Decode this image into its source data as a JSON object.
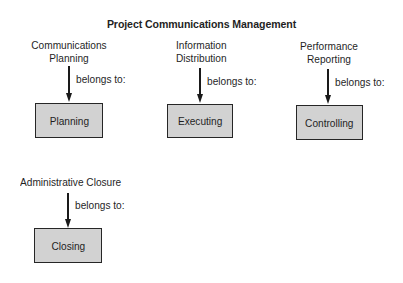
{
  "title": "Project Communications Management",
  "processes": [
    {
      "name_lines": [
        "Communications",
        "Planning"
      ],
      "relation": "belongs to:",
      "phase": "Planning"
    },
    {
      "name_lines": [
        "Information",
        "Distribution"
      ],
      "relation": "belongs to:",
      "phase": "Executing"
    },
    {
      "name_lines": [
        "Performance",
        "Reporting"
      ],
      "relation": "belongs to:",
      "phase": "Controlling"
    },
    {
      "name_lines": [
        "Administrative Closure"
      ],
      "relation": "belongs to:",
      "phase": "Closing"
    }
  ],
  "colors": {
    "box_fill": "#d2d2d2",
    "box_border": "#262626",
    "arrow": "#1a1a1a",
    "text": "#1f1f1f"
  }
}
